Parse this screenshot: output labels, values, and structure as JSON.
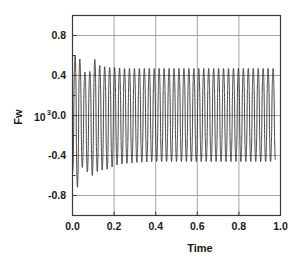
{
  "chart_data": {
    "type": "line",
    "title": "",
    "subtitle": "",
    "xlabel": "Time",
    "ylabel": "Fw",
    "ylabel_scale_base": "10",
    "ylabel_scale_exponent": "3",
    "xlim": [
      0.0,
      1.0
    ],
    "ylim": [
      -1.0,
      1.0
    ],
    "xticks": [
      0.0,
      0.2,
      0.4,
      0.6,
      0.8,
      1.0
    ],
    "xtick_labels": [
      "0.0",
      "0.2",
      "0.4",
      "0.6",
      "0.8",
      "1.0"
    ],
    "yticks": [
      0.8,
      0.4,
      0.0,
      -0.4,
      -0.8
    ],
    "ytick_labels": [
      "0.8",
      "0.4",
      "0.0",
      "-0.4",
      "-0.8"
    ],
    "grid": true,
    "grid_color": "#9a9a9a",
    "frame_color": "#3a3a3a",
    "line_color": "#2b2b2b",
    "line_width": 0.9,
    "legend": null,
    "annotations": [],
    "series": [
      {
        "name": "Fw",
        "oscillation_frequency_hz": 42,
        "steady_state_amplitude_positive": 0.47,
        "steady_state_amplitude_negative": -0.45,
        "transient_peak_positive": 0.81,
        "transient_peak_negative": -0.81,
        "transient_peak_time": 0.022,
        "transient_decay_time_constant": 0.055,
        "envelope_points": [
          {
            "t": 0.0,
            "pos": 0.52,
            "neg": -0.55
          },
          {
            "t": 0.01,
            "pos": 0.55,
            "neg": -0.81
          },
          {
            "t": 0.022,
            "pos": 0.81,
            "neg": -0.72
          },
          {
            "t": 0.035,
            "pos": 0.57,
            "neg": -0.7
          },
          {
            "t": 0.05,
            "pos": 0.4,
            "neg": -0.48
          },
          {
            "t": 0.065,
            "pos": 0.45,
            "neg": -0.55
          },
          {
            "t": 0.08,
            "pos": 0.43,
            "neg": -0.58
          },
          {
            "t": 0.095,
            "pos": 0.47,
            "neg": -0.6
          },
          {
            "t": 0.11,
            "pos": 0.58,
            "neg": -0.55
          },
          {
            "t": 0.13,
            "pos": 0.5,
            "neg": -0.57
          },
          {
            "t": 0.15,
            "pos": 0.49,
            "neg": -0.53
          },
          {
            "t": 0.175,
            "pos": 0.48,
            "neg": -0.54
          },
          {
            "t": 0.2,
            "pos": 0.48,
            "neg": -0.5
          },
          {
            "t": 0.25,
            "pos": 0.47,
            "neg": -0.48
          },
          {
            "t": 0.3,
            "pos": 0.47,
            "neg": -0.47
          },
          {
            "t": 0.4,
            "pos": 0.47,
            "neg": -0.46
          },
          {
            "t": 0.5,
            "pos": 0.47,
            "neg": -0.46
          },
          {
            "t": 0.6,
            "pos": 0.47,
            "neg": -0.46
          },
          {
            "t": 0.7,
            "pos": 0.47,
            "neg": -0.46
          },
          {
            "t": 0.8,
            "pos": 0.47,
            "neg": -0.46
          },
          {
            "t": 0.9,
            "pos": 0.47,
            "neg": -0.46
          },
          {
            "t": 0.975,
            "pos": 0.47,
            "neg": -0.46
          }
        ]
      }
    ]
  }
}
